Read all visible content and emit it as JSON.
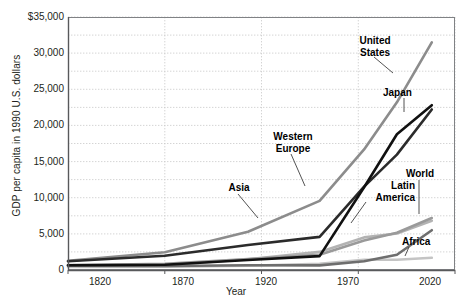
{
  "chart_data": {
    "type": "line",
    "title": "",
    "xlabel": "Year",
    "ylabel": "GDP per capita in 1990 U.S. dollars",
    "xlim": [
      1820,
      2020
    ],
    "ylim": [
      0,
      35000
    ],
    "grid": true,
    "legend_position": "inline-annotations",
    "xticks": [
      1820,
      1870,
      1920,
      1970,
      2020
    ],
    "xtick_labels": [
      "1820",
      "1870",
      "1920",
      "1970",
      "2020"
    ],
    "yticks": [
      0,
      5000,
      10000,
      15000,
      20000,
      25000,
      30000,
      35000
    ],
    "ytick_labels": [
      "0",
      "5,000",
      "10,000",
      "15,000",
      "20,000",
      "25,000",
      "30,000",
      "$35,000"
    ],
    "x": [
      1820,
      1870,
      1913,
      1950,
      1973,
      1990,
      2008
    ],
    "series": [
      {
        "name": "United States",
        "color": "#8c8c8c",
        "values": [
          1257,
          2445,
          5301,
          9561,
          16689,
          23201,
          31500
        ],
        "label_lines": "United\nStates"
      },
      {
        "name": "Japan",
        "color": "#111111",
        "values": [
          669,
          737,
          1387,
          1921,
          11434,
          18789,
          22800
        ],
        "label_lines": "Japan"
      },
      {
        "name": "Western Europe",
        "color": "#2b2b2b",
        "values": [
          1202,
          1960,
          3458,
          4579,
          11534,
          15966,
          22200
        ],
        "label_lines": "Western\nEurope"
      },
      {
        "name": "Asia",
        "color": "#6e6e6e",
        "values": [
          577,
          548,
          658,
          634,
          1212,
          2117,
          5500
        ],
        "label_lines": "Asia"
      },
      {
        "name": "Latin America",
        "color": "#b3b3b3",
        "values": [
          692,
          681,
          1481,
          2506,
          4504,
          5055,
          6800
        ],
        "label_lines": "Latin\nAmerica"
      },
      {
        "name": "World",
        "color": "#9a9a9a",
        "values": [
          666,
          870,
          1524,
          2111,
          4091,
          5157,
          7200
        ],
        "label_lines": "World"
      },
      {
        "name": "Africa",
        "color": "#c4c4c4",
        "values": [
          418,
          444,
          585,
          852,
          1410,
          1425,
          1700
        ],
        "label_lines": "Africa"
      }
    ],
    "annotations": [
      {
        "text": "United\nStates",
        "series": "United States"
      },
      {
        "text": "Japan",
        "series": "Japan"
      },
      {
        "text": "Western\nEurope",
        "series": "Western Europe"
      },
      {
        "text": "Asia",
        "series": "Asia"
      },
      {
        "text": "Latin\nAmerica",
        "series": "Latin America"
      },
      {
        "text": "World",
        "series": "World"
      },
      {
        "text": "Africa",
        "series": "Africa"
      }
    ]
  },
  "axis": {
    "y_title": "GDP per capita in 1990 U.S. dollars",
    "x_title": "Year",
    "y_labels": {
      "t35000": "$35,000",
      "t30000": "30,000",
      "t25000": "25,000",
      "t20000": "20,000",
      "t15000": "15,000",
      "t10000": "10,000",
      "t5000": "5,000",
      "t0": "0"
    },
    "x_labels": {
      "t1820": "1820",
      "t1870": "1870",
      "t1920": "1920",
      "t1970": "1970",
      "t2020": "2020"
    }
  },
  "labels": {
    "united_states": "United\nStates",
    "japan": "Japan",
    "western_europe": "Western\nEurope",
    "asia": "Asia",
    "latin_america": "Latin\nAmerica",
    "world": "World",
    "africa": "Africa"
  },
  "colors": {
    "axis": "#58595b",
    "grid": "#c9c9c9",
    "text": "#231f20",
    "plot_border": "#808285"
  }
}
